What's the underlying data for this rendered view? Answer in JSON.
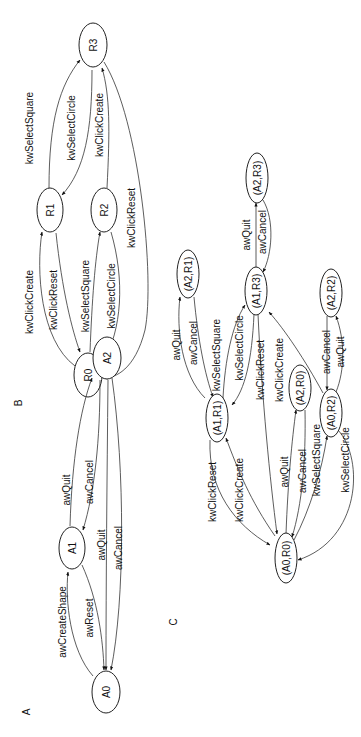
{
  "figure": {
    "panels": {
      "A": "A",
      "B": "B",
      "C": "C"
    },
    "diagram_a": {
      "nodes": {
        "A0": "A0",
        "A1": "A1",
        "A2": "A2"
      },
      "edges": [
        {
          "from": "A0",
          "to": "A1",
          "label": "awCreateShape"
        },
        {
          "from": "A1",
          "to": "A0",
          "label": "awReset"
        },
        {
          "from": "A1",
          "to": "A2",
          "label": "awQuit"
        },
        {
          "from": "A2",
          "to": "A1",
          "label": "awCancel"
        },
        {
          "from": "A2",
          "to": "A0",
          "label": "awQuit"
        },
        {
          "from": "A2",
          "to": "A0",
          "label": "awCancel"
        }
      ]
    },
    "diagram_b": {
      "nodes": {
        "R0": "R0",
        "R1": "R1",
        "R2": "R2",
        "R3": "R3"
      },
      "edges": [
        {
          "from": "R0",
          "to": "R1",
          "label": "kwClickCreate"
        },
        {
          "from": "R1",
          "to": "R0",
          "label": "kwClickReset"
        },
        {
          "from": "R0",
          "to": "R2",
          "label": "kwSelectSquare"
        },
        {
          "from": "R2",
          "to": "R0",
          "label": "kwSelectCircle"
        },
        {
          "from": "R1",
          "to": "R3",
          "label": "kwSelectSquare"
        },
        {
          "from": "R3",
          "to": "R1",
          "label": "kwSelectCircle"
        },
        {
          "from": "R2",
          "to": "R3",
          "label": "kwClickCreate"
        },
        {
          "from": "R3",
          "to": "R0",
          "label": "kwClickReset"
        }
      ]
    },
    "diagram_c": {
      "nodes": {
        "A0R0": "(A0,R0)",
        "A1R1": "(A1,R1)",
        "A2R1": "(A2,R1)",
        "A1R3": "(A1,R3)",
        "A2R3": "(A2,R3)",
        "A2R0": "(A2,R0)",
        "A0R2": "(A0,R2)",
        "A2R2": "(A2,R2)"
      },
      "edges": [
        {
          "from": "(A1,R1)",
          "to": "(A0,R0)",
          "label": "kwClickReset"
        },
        {
          "from": "(A0,R0)",
          "to": "(A1,R1)",
          "label": "kwClickCreate"
        },
        {
          "from": "(A0,R0)",
          "to": "(A2,R0)",
          "label": "awQuit"
        },
        {
          "from": "(A2,R0)",
          "to": "(A0,R0)",
          "label": "awCancel"
        },
        {
          "from": "(A0,R0)",
          "to": "(A0,R2)",
          "label": "kwSelectSquare"
        },
        {
          "from": "(A0,R2)",
          "to": "(A0,R0)",
          "label": "kwSelectCircle"
        },
        {
          "from": "(A1,R1)",
          "to": "(A2,R1)",
          "label": "awQuit"
        },
        {
          "from": "(A2,R1)",
          "to": "(A1,R1)",
          "label": "awCancel"
        },
        {
          "from": "(A1,R1)",
          "to": "(A1,R3)",
          "label": "kwSelectSquare"
        },
        {
          "from": "(A1,R3)",
          "to": "(A1,R1)",
          "label": "kwSelectCircle"
        },
        {
          "from": "(A1,R3)",
          "to": "(A0,R0)",
          "label": "kwClickReset"
        },
        {
          "from": "(A0,R2)",
          "to": "(A1,R3)",
          "label": "kwClickCreate"
        },
        {
          "from": "(A1,R3)",
          "to": "(A2,R3)",
          "label": "awQuit"
        },
        {
          "from": "(A2,R3)",
          "to": "(A1,R3)",
          "label": "awCancel"
        },
        {
          "from": "(A2,R2)",
          "to": "(A0,R2)",
          "label": "awCancel"
        },
        {
          "from": "(A0,R2)",
          "to": "(A2,R2)",
          "label": "awQuit"
        }
      ]
    }
  }
}
